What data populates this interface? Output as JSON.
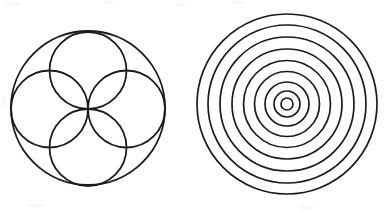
{
  "canvas": {
    "width": 386,
    "height": 211,
    "background_color": "#ffffff",
    "stroke_color": "#1c1c1c"
  },
  "figures": [
    {
      "name": "rosette-four-circles",
      "label": "Rosette of four circles inscribed in a circle",
      "center_x": 88,
      "center_y": 108,
      "outer_radius": 77,
      "outer_stroke_width": 1.9,
      "inner_stroke_width": 1.8,
      "petal_count": 4,
      "petal_radius": 38.5,
      "petal_center_offset": 38.5,
      "convergence_x": 88,
      "convergence_y": 110,
      "petals": [
        {
          "name": "petal-top",
          "cx": 88,
          "cy": 70.5,
          "r": 38.5
        },
        {
          "name": "petal-right",
          "cx": 126.5,
          "cy": 109,
          "r": 38.5
        },
        {
          "name": "petal-bottom",
          "cx": 88,
          "cy": 147.5,
          "r": 38.5
        },
        {
          "name": "petal-left",
          "cx": 49.5,
          "cy": 109,
          "r": 38.5
        }
      ]
    },
    {
      "name": "concentric-circles",
      "label": "Nine concentric circles",
      "center_x": 287,
      "center_y": 104,
      "ring_count": 9,
      "stroke_width": 1.7,
      "outer_radius": 90,
      "rings": [
        {
          "name": "ring-1",
          "r": 90
        },
        {
          "name": "ring-2",
          "r": 79
        },
        {
          "name": "ring-3",
          "r": 67
        },
        {
          "name": "ring-4",
          "r": 55
        },
        {
          "name": "ring-5",
          "r": 43.5
        },
        {
          "name": "ring-6",
          "r": 32.5
        },
        {
          "name": "ring-7",
          "r": 22
        },
        {
          "name": "ring-8",
          "r": 13
        },
        {
          "name": "ring-9",
          "r": 6
        }
      ]
    }
  ],
  "artifacts": [
    {
      "name": "scan-speck-top-left",
      "x": 6,
      "y": 2,
      "w": 14,
      "h": 4
    },
    {
      "name": "scan-speck-top-mid",
      "x": 104,
      "y": 1,
      "w": 11,
      "h": 3
    },
    {
      "name": "scan-speck-top-right",
      "x": 176,
      "y": 3,
      "w": 9,
      "h": 3
    },
    {
      "name": "scan-speck-top-far",
      "x": 232,
      "y": 1,
      "w": 12,
      "h": 3
    },
    {
      "name": "scan-speck-left-mid",
      "x": 2,
      "y": 96,
      "w": 4,
      "h": 10
    },
    {
      "name": "scan-speck-bottom",
      "x": 28,
      "y": 204,
      "w": 16,
      "h": 3
    },
    {
      "name": "scan-speck-bottom-two",
      "x": 300,
      "y": 206,
      "w": 13,
      "h": 3
    }
  ]
}
